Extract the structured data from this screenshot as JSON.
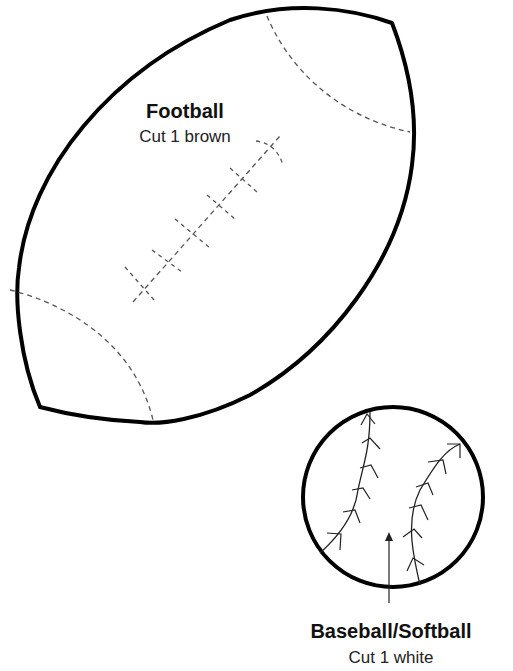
{
  "football": {
    "title": "Football",
    "instruction": "Cut 1 brown",
    "outline_color": "#000000",
    "seam_color": "#555555"
  },
  "baseball": {
    "title": "Baseball/Softball",
    "instruction": "Cut 1 white",
    "outline_color": "#000000",
    "stitch_color": "#222222"
  },
  "icons": {
    "grain_arrow": "arrow-up-icon"
  }
}
